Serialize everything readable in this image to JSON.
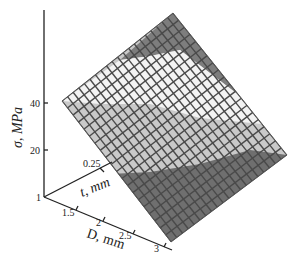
{
  "chart_data": {
    "type": "surface3d",
    "title": "",
    "axes": {
      "z": {
        "label": "σ, MPa",
        "ticks": [
          "1",
          "20",
          "40"
        ]
      },
      "y": {
        "label": "t, mm",
        "ticks": [
          "0.25"
        ]
      },
      "x": {
        "label": "D, mm",
        "ticks": [
          "1",
          "1.5",
          "2",
          "2.5",
          "3"
        ]
      }
    },
    "x_range": [
      1,
      3
    ],
    "z_range_visible": [
      1,
      60
    ],
    "grid": "wireframe mesh 20x20",
    "shading": "grayscale bands by height",
    "bands": [
      {
        "name": "top-dark",
        "color": "#7a7a7a"
      },
      {
        "name": "upper-light",
        "color": "#f2f2f2"
      },
      {
        "name": "middle-light-gray",
        "color": "#c8c8c8"
      },
      {
        "name": "lower-dark",
        "color": "#6e6e6e"
      }
    ],
    "surface_description": "Planar stress surface σ increasing with t and decreasing with D"
  },
  "labels": {
    "z_axis": "σ, MPa",
    "y_axis": "t, mm",
    "x_axis": "D, mm",
    "z_tick_40": "40",
    "z_tick_20": "20",
    "origin": "1",
    "y_tick_025": "0.25",
    "x_tick_15": "1.5",
    "x_tick_2": "2",
    "x_tick_25": "2.5",
    "x_tick_3": "3"
  }
}
